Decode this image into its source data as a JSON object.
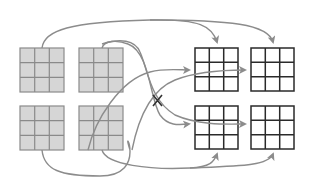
{
  "diagram": {
    "colors": {
      "input_fill": "#d6d6d6",
      "input_line": "#8a8a8a",
      "output_line": "#2a2a2a",
      "arrow": "#8c8c8c",
      "cross_mark": "#333333"
    },
    "input_grids": [
      {
        "id": "in-top-left",
        "x": 20,
        "y": 48,
        "size": 44,
        "rows": 3,
        "cols": 3
      },
      {
        "id": "in-top-right",
        "x": 79,
        "y": 48,
        "size": 44,
        "rows": 3,
        "cols": 3
      },
      {
        "id": "in-bottom-left",
        "x": 20,
        "y": 106,
        "size": 44,
        "rows": 3,
        "cols": 3
      },
      {
        "id": "in-bottom-right",
        "x": 79,
        "y": 106,
        "size": 44,
        "rows": 3,
        "cols": 3
      }
    ],
    "output_grids": [
      {
        "id": "out-top-left",
        "x": 195,
        "y": 48,
        "size": 43,
        "rows": 3,
        "cols": 3
      },
      {
        "id": "out-top-right",
        "x": 251,
        "y": 48,
        "size": 43,
        "rows": 3,
        "cols": 3
      },
      {
        "id": "out-bottom-left",
        "x": 195,
        "y": 106,
        "size": 43,
        "rows": 3,
        "cols": 3
      },
      {
        "id": "out-bottom-right",
        "x": 251,
        "y": 106,
        "size": 43,
        "rows": 3,
        "cols": 3
      }
    ],
    "cross_mark": {
      "label": "X",
      "x": 158,
      "y": 101
    }
  }
}
